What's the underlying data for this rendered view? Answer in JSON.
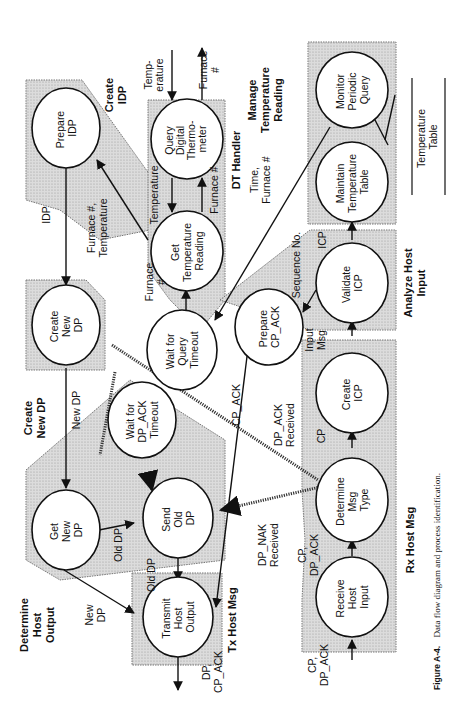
{
  "figure": {
    "caption_label": "Figure A-4.",
    "caption_text": "Data flow diagram and process identification.",
    "orientation": "rotated 90° counter-clockwise"
  },
  "groups": {
    "create_idp": "Create IDP",
    "dt_handler": "DT Handler",
    "manage_temperature_reading": "Manage Temperature Reading",
    "create_new_dp": "Create New DP",
    "analyze_host_input": "Analyze Host Input",
    "determine_host_output": "Determine Host Output",
    "tx_host_msg": "Tx Host Msg",
    "rx_host_msg": "Rx Host Msg"
  },
  "processes": {
    "prepare_idp": [
      "Prepare",
      "IDP"
    ],
    "query_digital_thermometer": [
      "Query",
      "Digital",
      "Thermo-",
      "meter"
    ],
    "get_temperature_reading": [
      "Get",
      "Temperature",
      "Reading"
    ],
    "monitor_periodic_query": [
      "Monitor",
      "Periodic",
      "Query"
    ],
    "maintain_temperature_table": [
      "Maintain",
      "Temperature",
      "Table"
    ],
    "create_new_dp": [
      "Create",
      "New",
      "DP"
    ],
    "wait_for_query_timeout": [
      "Wait for",
      "Query",
      "Timeout"
    ],
    "prepare_cp_ack": [
      "Prepare",
      "CP_ACK"
    ],
    "validate_icp": [
      "Validate",
      "ICP"
    ],
    "wait_for_dp_ack_timeout": [
      "Wait for",
      "DP_ACK",
      "Timeout"
    ],
    "create_icp": [
      "Create",
      "ICP"
    ],
    "get_new_dp": [
      "Get",
      "New",
      "DP"
    ],
    "send_old_dp": [
      "Send",
      "Old",
      "DP"
    ],
    "determine_msg_type": [
      "Determine",
      "Msg",
      "Type"
    ],
    "transmit_host_output": [
      "Transmit",
      "Host",
      "Output"
    ],
    "receive_host_input": [
      "Receive",
      "Host",
      "Input"
    ]
  },
  "data_store": {
    "temperature_table": [
      "Temperature",
      "Table"
    ]
  },
  "flows": {
    "temperature_in": [
      "Temp-",
      "erature"
    ],
    "furnace_out": [
      "Furnace",
      "#"
    ],
    "temperature": "Temperature",
    "furnace_num": "Furnace #",
    "furnace_num_2": "Furnace #",
    "idp": "IDP",
    "furnace_temperature": [
      "Furnace #,",
      "Temperature"
    ],
    "time_furnace": [
      "Time,",
      "Furnace #"
    ],
    "furnace_hash": [
      "Furnace",
      "#"
    ],
    "sequence_no": "Sequence No.",
    "icp": "ICP",
    "input_msg": [
      "Input",
      "Msg"
    ],
    "new_dp": "New DP",
    "cp_ack": "CP_ACK",
    "dp_ack_received": [
      "DP_ACK",
      "Received"
    ],
    "cp": "CP",
    "old_dp": "Old DP",
    "old_dp_2": "Old DP",
    "new_dp_2": [
      "New",
      "DP"
    ],
    "dp_nak_received": [
      "DP_NAK",
      "Received"
    ],
    "cp_dp_ack": [
      "CP,",
      "DP_ACK"
    ],
    "dp_cp_ack": [
      "DP,",
      "CP_ACK"
    ],
    "cp_dp_ack_in": [
      "CP,",
      "DP_ACK"
    ]
  }
}
